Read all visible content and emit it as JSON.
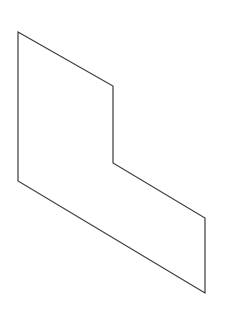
{
  "canvas": {
    "width": 229,
    "height": 314,
    "background": "#ffffff"
  },
  "shape": {
    "type": "polygon",
    "description": "L-shaped hexagon outline (oblique projection)",
    "stroke": "#3a3a3a",
    "stroke_width": 1.2,
    "fill": "none",
    "points": [
      [
        18,
        32
      ],
      [
        113,
        86
      ],
      [
        113,
        163
      ],
      [
        205,
        218
      ],
      [
        205,
        293
      ],
      [
        18,
        181
      ]
    ]
  }
}
